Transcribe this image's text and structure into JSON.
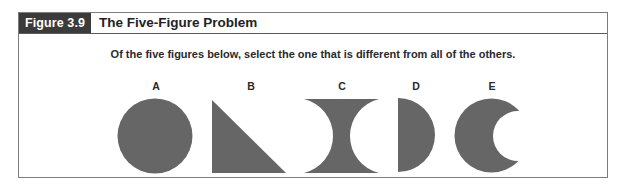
{
  "figure": {
    "label": "Figure 3.9",
    "title": "The Five-Figure Problem",
    "instruction": "Of the five figures below, select the one that is different from all of the others.",
    "colors": {
      "label_bg": "#3b3b3b",
      "shape_fill": "#666666",
      "border": "#7d7d7d"
    },
    "options": [
      {
        "letter": "A",
        "shape": "circle"
      },
      {
        "letter": "B",
        "shape": "right-triangle"
      },
      {
        "letter": "C",
        "shape": "concave-hourglass"
      },
      {
        "letter": "D",
        "shape": "half-circle"
      },
      {
        "letter": "E",
        "shape": "crescent"
      }
    ]
  }
}
